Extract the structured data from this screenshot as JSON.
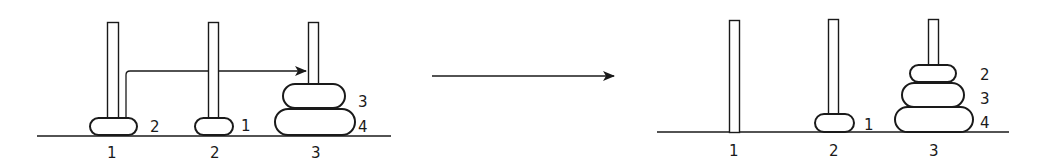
{
  "diagram": {
    "title": "",
    "before": {
      "peg_labels": [
        "1",
        "2",
        "3"
      ],
      "disk_labels": {
        "peg1": [
          "2"
        ],
        "peg2": [
          "1"
        ],
        "peg3": [
          "3",
          "4"
        ]
      },
      "move_arrow": {
        "from_peg": "1",
        "to_peg": "3"
      }
    },
    "transition_arrow": "→",
    "after": {
      "peg_labels": [
        "1",
        "2",
        "3"
      ],
      "disk_labels": {
        "peg1": [],
        "peg2": [
          "1"
        ],
        "peg3": [
          "2",
          "3",
          "4"
        ]
      }
    },
    "colors": {
      "ink": "#1a1a1a",
      "background": "#ffffff"
    }
  }
}
